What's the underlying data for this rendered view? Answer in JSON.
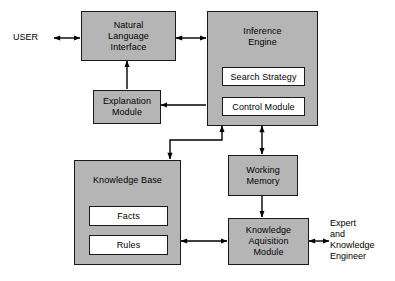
{
  "diagram": {
    "background_color": "#ffffff",
    "node_fill": "#b5b5b5",
    "subnode_fill": "#ffffff",
    "line_color": "#000000"
  },
  "nodes": {
    "natural_language_interface": "Natural\nLanguage\nInterface",
    "inference_engine": "Inference\nEngine",
    "search_strategy": "Search Strategy",
    "control_module": "Control Module",
    "explanation_module": "Explanation\nModule",
    "knowledge_base": "Knowledge Base",
    "facts": "Facts",
    "rules": "Rules",
    "working_memory": "Working\nMemory",
    "knowledge_acquisition_module": "Knowledge\nAquisition\nModule"
  },
  "labels": {
    "user": "USER",
    "expert_engineer": "Expert\nand\nKnowledge\nEngineer"
  },
  "connections": [
    {
      "name": "user-to-nli",
      "from": "USER",
      "to": "Natural Language Interface",
      "arrows": "both"
    },
    {
      "name": "nli-to-inference-engine",
      "from": "Natural Language Interface",
      "to": "Inference Engine",
      "arrows": "both"
    },
    {
      "name": "explanation-to-nli",
      "from": "Explanation Module",
      "to": "Natural Language Interface",
      "arrows": "to"
    },
    {
      "name": "inference-engine-to-explanation",
      "from": "Inference Engine",
      "to": "Explanation Module",
      "arrows": "to"
    },
    {
      "name": "knowledge-base-to-inference-engine",
      "from": "Knowledge Base",
      "to": "Inference Engine",
      "arrows": "both"
    },
    {
      "name": "inference-engine-to-working-memory",
      "from": "Inference Engine",
      "to": "Working Memory",
      "arrows": "both"
    },
    {
      "name": "working-memory-to-knowledge-acquisition",
      "from": "Working Memory",
      "to": "Knowledge Aquisition Module",
      "arrows": "to"
    },
    {
      "name": "knowledge-base-to-knowledge-acquisition",
      "from": "Knowledge Base",
      "to": "Knowledge Aquisition Module",
      "arrows": "both"
    },
    {
      "name": "knowledge-acquisition-to-expert",
      "from": "Knowledge Aquisition Module",
      "to": "Expert and Knowledge Engineer",
      "arrows": "both"
    }
  ]
}
